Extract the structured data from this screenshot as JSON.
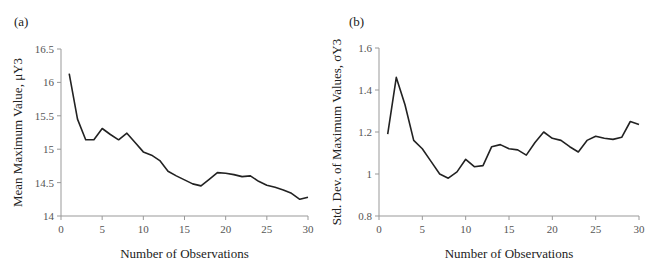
{
  "chart_data": [
    {
      "panel_label": "(a)",
      "type": "line",
      "title": "",
      "xlabel": "Number of Observations",
      "ylabel": "Mean Maximum Value, μY3",
      "xlim": [
        0,
        30
      ],
      "ylim": [
        14,
        16.5
      ],
      "xticks": [
        0,
        5,
        10,
        15,
        20,
        25,
        30
      ],
      "yticks": [
        14,
        14.5,
        15,
        15.5,
        16,
        16.5
      ],
      "ytick_labels": [
        "14",
        "14.5",
        "15",
        "15.5",
        "16",
        "16.5"
      ],
      "grid": false,
      "legend": null,
      "x": [
        1,
        2,
        3,
        4,
        5,
        6,
        7,
        8,
        9,
        10,
        11,
        12,
        13,
        14,
        15,
        16,
        17,
        18,
        19,
        20,
        21,
        22,
        23,
        24,
        25,
        26,
        27,
        28,
        29,
        30
      ],
      "values": [
        16.13,
        15.45,
        15.14,
        15.14,
        15.31,
        15.22,
        15.14,
        15.24,
        15.1,
        14.96,
        14.91,
        14.83,
        14.67,
        14.6,
        14.54,
        14.48,
        14.45,
        14.55,
        14.65,
        14.64,
        14.62,
        14.59,
        14.6,
        14.52,
        14.46,
        14.43,
        14.39,
        14.34,
        14.25,
        14.28
      ]
    },
    {
      "panel_label": "(b)",
      "type": "line",
      "title": "",
      "xlabel": "Number of Observations",
      "ylabel": "Std. Dev. of Maximum Values, σY3",
      "xlim": [
        0,
        30
      ],
      "ylim": [
        0.8,
        1.6
      ],
      "xticks": [
        0,
        5,
        10,
        15,
        20,
        25,
        30
      ],
      "yticks": [
        0.8,
        1.0,
        1.2,
        1.4,
        1.6
      ],
      "ytick_labels": [
        "0.8",
        "1",
        "1.2",
        "1.4",
        "1.6"
      ],
      "grid": false,
      "legend": null,
      "x": [
        1,
        2,
        3,
        4,
        5,
        6,
        7,
        8,
        9,
        10,
        11,
        12,
        13,
        14,
        15,
        16,
        17,
        18,
        19,
        20,
        21,
        22,
        23,
        24,
        25,
        26,
        27,
        28,
        29,
        30
      ],
      "values": [
        1.19,
        1.46,
        1.33,
        1.16,
        1.12,
        1.06,
        1.0,
        0.98,
        1.01,
        1.07,
        1.035,
        1.04,
        1.13,
        1.14,
        1.12,
        1.115,
        1.09,
        1.15,
        1.2,
        1.17,
        1.16,
        1.13,
        1.105,
        1.16,
        1.18,
        1.17,
        1.165,
        1.175,
        1.25,
        1.235
      ]
    }
  ]
}
